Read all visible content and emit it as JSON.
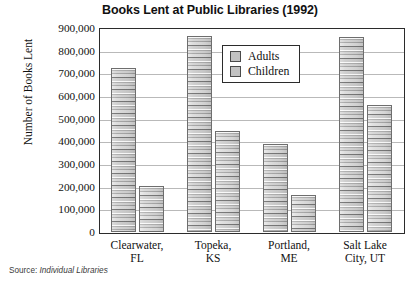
{
  "chart_data": {
    "type": "bar",
    "title": "Books Lent at Public Libraries (1992)",
    "xlabel": "",
    "ylabel": "Number of Books Lent",
    "ylim": [
      0,
      900000
    ],
    "ytick_step": 100000,
    "grid": true,
    "legend_position": "inside-top-center",
    "categories": [
      "Clearwater, FL",
      "Topeka, KS",
      "Portland, ME",
      "Salt Lake City, UT"
    ],
    "category_lines": [
      [
        "Clearwater,",
        "FL"
      ],
      [
        "Topeka,",
        "KS"
      ],
      [
        "Portland,",
        "ME"
      ],
      [
        "Salt Lake",
        "City, UT"
      ]
    ],
    "series": [
      {
        "name": "Adults",
        "values": [
          725000,
          865000,
          390000,
          860000
        ]
      },
      {
        "name": "Children",
        "values": [
          205000,
          445000,
          165000,
          560000
        ]
      }
    ],
    "ytick_labels": [
      "900,000",
      "800,000",
      "700,000",
      "600,000",
      "500,000",
      "400,000",
      "300,000",
      "200,000",
      "100,000",
      "0"
    ],
    "ytick_values": [
      900000,
      800000,
      700000,
      600000,
      500000,
      400000,
      300000,
      200000,
      100000,
      0
    ],
    "source_prefix": "Source:",
    "source_ref": "Individual Libraries",
    "colors": {
      "bar_fill": "#cfcfcf",
      "bar_border": "#6e6e6e",
      "frame": "#2b2b2b",
      "gridline": "#b9b9b9",
      "text": "#111111",
      "background": "#ffffff"
    }
  },
  "legend": {
    "items": [
      {
        "label": "Adults",
        "swatch": "legend-swatch-adults"
      },
      {
        "label": "Children",
        "swatch": "legend-swatch-children"
      }
    ]
  }
}
